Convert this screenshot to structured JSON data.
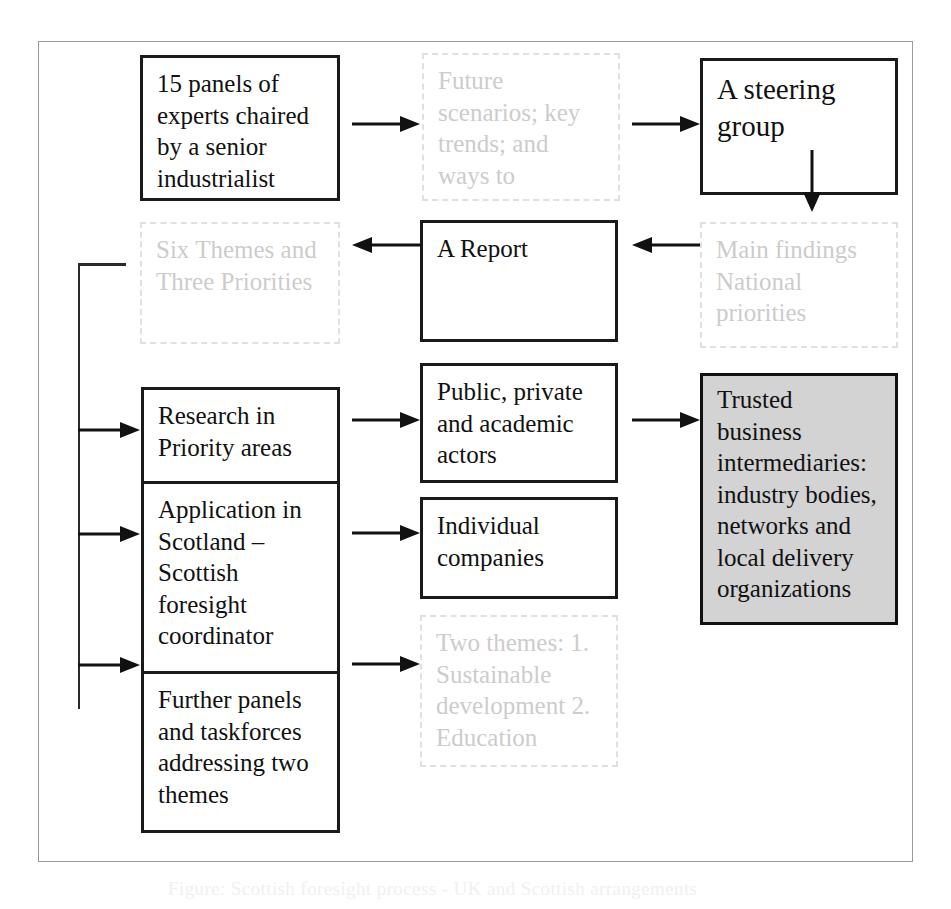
{
  "figure": {
    "title_fragment": "Figure: Scottish foresight process - UK and Scottish arrangements"
  },
  "boxes": {
    "panels": {
      "text": "15 panels of experts chaired by a senior industrialist",
      "style": "solid"
    },
    "future_scenarios": {
      "text": "Future scenarios; key trends; and ways to",
      "style": "faded"
    },
    "steering_group": {
      "text": "A steering group",
      "style": "solid-large"
    },
    "six_themes": {
      "text": "Six Themes and Three Priorities",
      "style": "faded"
    },
    "a_report": {
      "text": "A Report",
      "style": "solid"
    },
    "main_findings": {
      "text": "Main findings National priorities",
      "style": "faded"
    },
    "research_priority": {
      "text": "Research in Priority areas",
      "style": "solid"
    },
    "application_scotland": {
      "text": "Application in Scotland – Scottish foresight coordinator",
      "style": "solid"
    },
    "further_panels": {
      "text": "Further panels and taskforces addressing two themes",
      "style": "solid"
    },
    "public_private": {
      "text": "Public, private and academic actors",
      "style": "solid"
    },
    "individual_companies": {
      "text": "Individual companies",
      "style": "solid"
    },
    "two_themes": {
      "text": "Two themes: 1. Sustainable development 2. Education",
      "style": "faded"
    },
    "trusted_intermediaries": {
      "text": "Trusted business intermediaries: industry bodies, networks and local delivery organizations",
      "style": "shaded"
    }
  },
  "connectors": [
    {
      "name": "panels-to-future-scenarios",
      "direction": "right"
    },
    {
      "name": "future-scenarios-to-steering-group",
      "direction": "right"
    },
    {
      "name": "steering-group-down",
      "direction": "down"
    },
    {
      "name": "main-findings-to-report",
      "direction": "left"
    },
    {
      "name": "report-to-six-themes",
      "direction": "left"
    },
    {
      "name": "six-themes-bracket-to-research",
      "direction": "right"
    },
    {
      "name": "six-themes-bracket-to-application",
      "direction": "right"
    },
    {
      "name": "six-themes-bracket-to-further-panels",
      "direction": "right"
    },
    {
      "name": "research-to-public-private",
      "direction": "right"
    },
    {
      "name": "public-private-to-trusted",
      "direction": "right"
    },
    {
      "name": "application-to-individual-companies",
      "direction": "right"
    },
    {
      "name": "further-panels-to-two-themes",
      "direction": "right"
    }
  ],
  "colors": {
    "box_border": "#1a1a1a",
    "faded_text": "#cccccc",
    "faded_border": "#e0e0e0",
    "shaded_fill": "#d3d3d3",
    "frame": "#9a9a9a",
    "arrow": "#111111"
  }
}
